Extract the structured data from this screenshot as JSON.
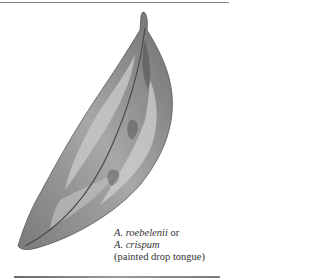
{
  "illustration": {
    "subject": "leaf-illustration"
  },
  "caption": {
    "line1_name": "A. roebelenii",
    "line1_suffix": " or",
    "line2_name": "A. crispum",
    "line3": "(painted drop tongue)"
  }
}
